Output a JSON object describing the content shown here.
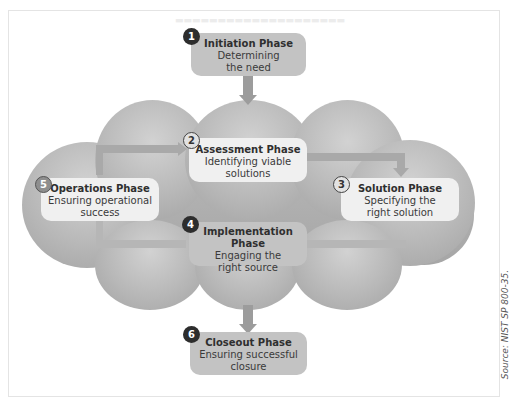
{
  "diagram": {
    "phases": [
      {
        "number": "1",
        "title": "Initiation Phase",
        "line1": "Determining",
        "line2": "the need"
      },
      {
        "number": "2",
        "title": "Assessment Phase",
        "line1": "Identifying viable",
        "line2": "solutions"
      },
      {
        "number": "3",
        "title": "Solution Phase",
        "line1": "Specifying the",
        "line2": "right solution"
      },
      {
        "number": "4",
        "title": "Implementation Phase",
        "line1": "Engaging the",
        "line2": "right source"
      },
      {
        "number": "5",
        "title": "Operations Phase",
        "line1": "Ensuring operational",
        "line2": "success"
      },
      {
        "number": "6",
        "title": "Closeout Phase",
        "line1": "Ensuring successful",
        "line2": "closure"
      }
    ],
    "source": "Source: NIST SP 800-35.",
    "colors": {
      "cloud": "#b0b0b0",
      "box_dark": "#c3c3c3",
      "box_light": "#f0f0f0",
      "arrow": "#9c9c9c",
      "badge_dark": "#2d2d2d"
    }
  }
}
